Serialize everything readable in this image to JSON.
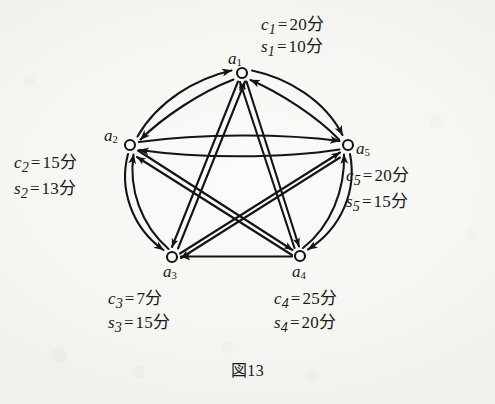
{
  "figure": {
    "caption": "図13",
    "unit_suffix": "分",
    "ink_color": "#141414",
    "paper_color": "#f7f7f4"
  },
  "graph": {
    "type": "directed-complete-graph",
    "node_count": 5,
    "nodes": [
      {
        "id": "a1",
        "label": "a",
        "index": "1",
        "x": 242,
        "y": 73,
        "attributes": [
          {
            "symbol": "c",
            "index": "1",
            "eq": "=",
            "value": "20",
            "unit": "分",
            "text": "c₁ = 20分"
          },
          {
            "symbol": "s",
            "index": "1",
            "eq": "=",
            "value": "10",
            "unit": "分",
            "text": "s₁ = 10分"
          }
        ]
      },
      {
        "id": "a2",
        "label": "a",
        "index": "2",
        "x": 130,
        "y": 145,
        "attributes": [
          {
            "symbol": "c",
            "index": "2",
            "eq": "=",
            "value": "15",
            "unit": "分",
            "text": "c₂ = 15分"
          },
          {
            "symbol": "s",
            "index": "2",
            "eq": "=",
            "value": "13",
            "unit": "分",
            "text": "s₂ = 13分"
          }
        ]
      },
      {
        "id": "a3",
        "label": "a",
        "index": "3",
        "x": 172,
        "y": 257,
        "attributes": [
          {
            "symbol": "c",
            "index": "3",
            "eq": "=",
            "value": "7",
            "unit": "分",
            "text": "c₃ = 7分"
          },
          {
            "symbol": "s",
            "index": "3",
            "eq": "=",
            "value": "15",
            "unit": "分",
            "text": "s₃ = 15分"
          }
        ]
      },
      {
        "id": "a4",
        "label": "a",
        "index": "4",
        "x": 300,
        "y": 256,
        "attributes": [
          {
            "symbol": "c",
            "index": "4",
            "eq": "=",
            "value": "25",
            "unit": "分",
            "text": "c₄ = 25分"
          },
          {
            "symbol": "s",
            "index": "4",
            "eq": "=",
            "value": "20",
            "unit": "分",
            "text": "s₄ = 20分"
          }
        ]
      },
      {
        "id": "a5",
        "label": "a",
        "index": "5",
        "x": 348,
        "y": 145,
        "attributes": [
          {
            "symbol": "c",
            "index": "5",
            "eq": "=",
            "value": "20",
            "unit": "分",
            "text": "c₅ = 20分"
          },
          {
            "symbol": "s",
            "index": "5",
            "eq": "=",
            "value": "15",
            "unit": "分",
            "text": "s₅ = 15分"
          }
        ]
      }
    ],
    "edges": [
      {
        "from": "a1",
        "to": "a2",
        "style": "curved"
      },
      {
        "from": "a2",
        "to": "a1",
        "style": "curved"
      },
      {
        "from": "a1",
        "to": "a5",
        "style": "curved"
      },
      {
        "from": "a5",
        "to": "a1",
        "style": "curved"
      },
      {
        "from": "a2",
        "to": "a5",
        "style": "curved"
      },
      {
        "from": "a5",
        "to": "a2",
        "style": "curved"
      },
      {
        "from": "a2",
        "to": "a3",
        "style": "curved"
      },
      {
        "from": "a3",
        "to": "a2",
        "style": "curved"
      },
      {
        "from": "a5",
        "to": "a4",
        "style": "curved"
      },
      {
        "from": "a4",
        "to": "a5",
        "style": "curved"
      },
      {
        "from": "a4",
        "to": "a3",
        "style": "straight"
      },
      {
        "from": "a1",
        "to": "a3",
        "style": "straight"
      },
      {
        "from": "a3",
        "to": "a1",
        "style": "straight"
      },
      {
        "from": "a1",
        "to": "a4",
        "style": "straight"
      },
      {
        "from": "a4",
        "to": "a1",
        "style": "straight"
      },
      {
        "from": "a2",
        "to": "a4",
        "style": "straight"
      },
      {
        "from": "a4",
        "to": "a2",
        "style": "straight"
      },
      {
        "from": "a3",
        "to": "a5",
        "style": "straight"
      },
      {
        "from": "a5",
        "to": "a3",
        "style": "straight"
      }
    ]
  }
}
